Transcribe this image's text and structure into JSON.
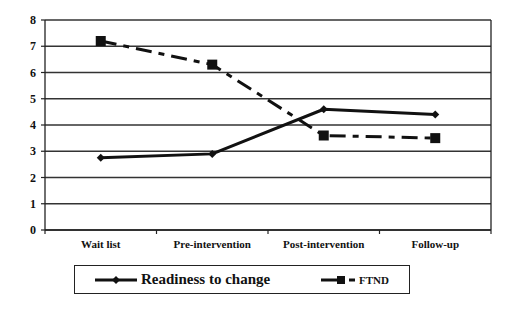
{
  "chart_data": {
    "type": "line",
    "title": "",
    "xlabel": "",
    "ylabel": "",
    "categories": [
      "Wait list",
      "Pre-intervention",
      "Post-intervention",
      "Follow-up"
    ],
    "ylim": [
      0,
      8
    ],
    "yticks": [
      0,
      1,
      2,
      3,
      4,
      5,
      6,
      7,
      8
    ],
    "grid": true,
    "legend_position": "bottom",
    "series": [
      {
        "name": "Readiness to change",
        "values": [
          2.75,
          2.9,
          4.6,
          4.4
        ],
        "marker": "diamond",
        "line_style": "solid",
        "color": "#111111"
      },
      {
        "name": "FTND",
        "values": [
          7.2,
          6.3,
          3.6,
          3.5
        ],
        "marker": "square",
        "line_style": "dash-dot",
        "color": "#111111"
      }
    ]
  },
  "legend": {
    "items": [
      {
        "label": "Readiness to change"
      },
      {
        "label": "FTND"
      }
    ]
  }
}
